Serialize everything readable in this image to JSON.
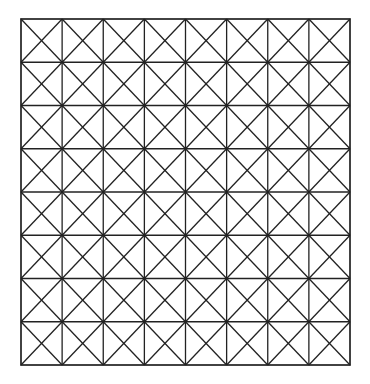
{
  "diagram": {
    "type": "triangulated-grid",
    "rows": 8,
    "columns": 8,
    "cell_diagonals": [
      "top-left-to-bottom-right",
      "top-right-to-bottom-left"
    ],
    "bounds": {
      "left": 21,
      "top": 19,
      "right": 350,
      "bottom": 365
    },
    "line_color": "#222222",
    "background_color": "#ffffff",
    "line_width": 1.3
  }
}
